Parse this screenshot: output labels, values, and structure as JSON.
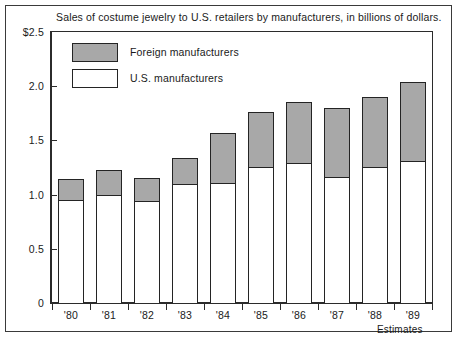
{
  "chart_data": {
    "type": "bar",
    "subtype": "stacked-bar",
    "title": "Sales of costume jewelry to U.S. retailers by manufacturers, in billions of dollars.",
    "xlabel": "",
    "ylabel": "",
    "categories": [
      "'80",
      "'81",
      "'82",
      "'83",
      "'84",
      "'85",
      "'86",
      "'87",
      "'88",
      "'89"
    ],
    "series": [
      {
        "name": "U.S. manufacturers",
        "color": "#ffffff",
        "values": [
          0.95,
          1.0,
          0.94,
          1.1,
          1.11,
          1.25,
          1.29,
          1.16,
          1.25,
          1.31
        ]
      },
      {
        "name": "Foreign manufacturers",
        "color": "#a8a8a8",
        "values": [
          0.19,
          0.23,
          0.21,
          0.24,
          0.46,
          0.51,
          0.56,
          0.64,
          0.65,
          0.73
        ]
      }
    ],
    "totals": [
      1.14,
      1.23,
      1.15,
      1.34,
      1.57,
      1.76,
      1.85,
      1.8,
      1.9,
      2.04
    ],
    "ylim": [
      0,
      2.5
    ],
    "yticks": [
      0,
      0.5,
      1.0,
      1.5,
      2.0,
      2.5
    ],
    "ytick_labels": [
      "0",
      "0.5",
      "1.0",
      "1.5",
      "2.0",
      "$2.5"
    ],
    "grid": false,
    "legend_position": "top-left",
    "annotations": [
      {
        "text": "Estimates",
        "near": "'88-'89"
      }
    ]
  },
  "legend": {
    "items": [
      {
        "label": "Foreign manufacturers",
        "color": "#a8a8a8"
      },
      {
        "label": "U.S. manufacturers",
        "color": "#ffffff"
      }
    ]
  },
  "axis": {
    "y_tick_labels": [
      "$2.5",
      "2.0",
      "1.5",
      "1.0",
      "0.5",
      "0"
    ],
    "x_tick_labels": [
      "'80",
      "'81",
      "'82",
      "'83",
      "'84",
      "'85",
      "'86",
      "'87",
      "'88",
      "'89"
    ]
  },
  "footnote": "Estimates",
  "colors": {
    "foreign_fill": "#a8a8a8",
    "us_fill": "#ffffff",
    "outline": "#242424",
    "axis": "#2b2b2b",
    "text": "#1a1a1a",
    "background": "#ffffff"
  }
}
